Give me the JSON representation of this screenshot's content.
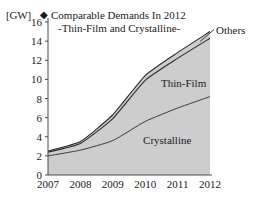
{
  "chart_data": {
    "type": "area",
    "stacked": true,
    "title": "Comparable Demands In 2012",
    "subtitle": "-Thin-Film and Crystalline-",
    "title_marker": "◆",
    "ylabel": "[GW]",
    "xlabel": "",
    "categories": [
      "2007",
      "2008",
      "2009",
      "2010",
      "2011",
      "2012"
    ],
    "x": [
      2007,
      2008,
      2009,
      2010,
      2011,
      2012
    ],
    "ylim": [
      0,
      16
    ],
    "yticks": [
      0,
      2,
      4,
      6,
      8,
      10,
      12,
      14,
      16
    ],
    "grid": false,
    "legend_position": "inline-labels",
    "series": [
      {
        "name": "Crystalline",
        "values": [
          2.0,
          2.6,
          3.6,
          5.6,
          7.0,
          8.2
        ]
      },
      {
        "name": "Thin-Film",
        "values": [
          0.4,
          0.7,
          2.3,
          4.3,
          5.2,
          6.1
        ]
      },
      {
        "name": "Others",
        "values": [
          0.1,
          0.2,
          0.4,
          0.5,
          0.6,
          0.7
        ]
      }
    ],
    "cumulative_tops": {
      "crystalline": [
        2.0,
        2.6,
        3.6,
        5.6,
        7.0,
        8.2
      ],
      "thin_film": [
        2.4,
        3.3,
        5.9,
        9.9,
        12.2,
        14.3
      ],
      "others": [
        2.5,
        3.5,
        6.3,
        10.4,
        12.8,
        15.0
      ]
    },
    "annotations": [
      {
        "text": "Others",
        "kind": "callout-label"
      },
      {
        "text": "Thin-Film",
        "kind": "inline-label"
      },
      {
        "text": "Crystalline",
        "kind": "inline-label"
      }
    ],
    "colors": {
      "fill": "#cdcdcd",
      "outline": "#2b2b2b",
      "axis": "#4a4a4a",
      "text": "#1a1a1a",
      "background": "#ffffff"
    }
  }
}
